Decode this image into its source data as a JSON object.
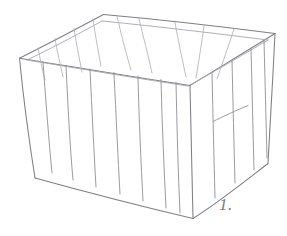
{
  "figure": {
    "caption": "1.",
    "background_color": "#ffffff",
    "ink_color": "#8d8d90",
    "medium": "graphite pencil line sketch"
  },
  "geometry": {
    "units": "pixels",
    "canvas": {
      "width": 287,
      "height": 236
    },
    "vertices": {
      "top_back": [
        103,
        14
      ],
      "top_left": [
        19,
        58
      ],
      "top_front": [
        190,
        85
      ],
      "top_right": [
        275,
        33
      ],
      "bottom_left": [
        35,
        178
      ],
      "bottom_front": [
        193,
        218
      ],
      "bottom_right": [
        268,
        163
      ]
    },
    "top_rim_outer": "103,14 -> 19,58 -> 190,85 -> 275,33 -> 103,14",
    "top_rim_inner_offset_px": 5,
    "front_left_panel": {
      "corners": "19,58 190,85 193,218 35,178",
      "slat_count": 7
    },
    "front_right_panel": {
      "corners": "190,85 275,33 268,163 193,218",
      "slat_count": 4
    },
    "inner_back_wall": {
      "corners": "103,14 190,85 275,33",
      "slat_count": 5
    },
    "inner_left_wall": {
      "corners": "103,14 19,58 190,85",
      "slat_count": 4
    },
    "right_panel_crossbar": {
      "from": [
        213,
        121
      ],
      "to": [
        248,
        106
      ]
    }
  },
  "strokes": {
    "rim_outer": [
      "M 103.5 14.5 C 80 27 54 41 19.5 58.2",
      "M 19.5 58.2 C 63 65 120 75 190 85.5",
      "M 190 85.5 C 215 70 247 51 275 33.5",
      "M 275 33.5 C 225 27 165 20 103.5 14.5"
    ],
    "rim_inner": [
      "M 102 21 C 82 32 58 45 27 60",
      "M 27 60 C 70 67 122 76 188 86",
      "M 188 86 C 212 73 241 56 268 40",
      "M 268 40 C 220 34 163 27 102 21"
    ],
    "verticals": [
      "M 19.5 58.2 C 23 95 29 140 35 178",
      "M 190 85.5 C 191 130 192 178 193 218",
      "M 275 33.5 C 273 77 270 123 268 163"
    ],
    "bottom_edges": [
      "M 35 178 C 82 191 140 206 193 218.5",
      "M 193 218.5 C 218 203 244 182 268 163.5"
    ],
    "front_left_slats": [
      "M 43 62.0 C 46 103 49 142 52 173",
      "M 66 65.5 C 68 107 70 147 73 180",
      "M 90 69.0 C 92 112 94 152 96 187",
      "M 114 72.5 C 116 116 118 157 120 194",
      "M 138 76.0 C 139 120 141 162 143 201",
      "M 161 79.5 C 162 124 164 167 166 208",
      "M 176 82.0 C 177 127 178 171 180 213"
    ],
    "front_right_slats": [
      "M 212 72.5 C 213 117 214 160 215 198",
      "M 232 60.5 C 233 103 234 145 235 183",
      "M 251 48.5 C 252 89 253 129 254 170",
      "M 264 40.5 C 265 80 266 119 267 158"
    ],
    "inner_back_slats": [
      "M 117 16 C 121 34 126 53 131 70",
      "M 139 18.5 C 143 36 148 54 152 73",
      "M 175 22.5 C 178 40 182 58 186 77",
      "M 204 25.5 C 202 42 199 59 196 78",
      "M 234 28.8 C 229 45 223 61 217 79"
    ],
    "inner_left_slats": [
      "M 93 19.0 C 95 34 98 50 101 66",
      "M 74 28.5 C 76 42 79 57 82 72",
      "M 55 38.5 C 57 51 60 63 63 77",
      "M 38 48.0 C 40 58 42 69 45 80"
    ],
    "right_crossbar": [
      "M 213 121.5 C 222 117 237 110 248 105.5"
    ]
  }
}
